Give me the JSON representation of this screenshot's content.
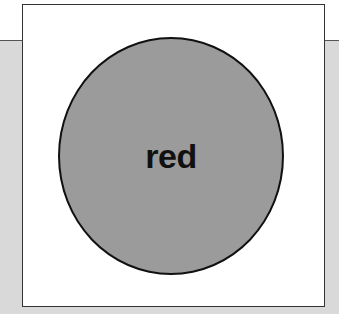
{
  "card": {
    "shape": "circle",
    "label": "red",
    "fill_color": "#9b9b9b",
    "background_color": "#d9d9d9"
  }
}
